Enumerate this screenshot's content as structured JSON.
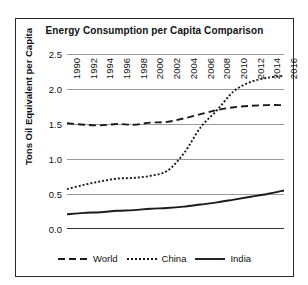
{
  "chart_data": {
    "type": "line",
    "title": "Energy Consumption per Capita Comparison",
    "xlabel": "",
    "ylabel": "Tons Oil Equivalent per Capita",
    "ylim": [
      0.0,
      2.5
    ],
    "yticks": [
      "0.0",
      "0.5",
      "1.0",
      "1.5",
      "2.0",
      "2.5"
    ],
    "ytick_values": [
      0.0,
      0.5,
      1.0,
      1.5,
      2.0,
      2.5
    ],
    "grid": true,
    "legend_position": "bottom",
    "x": [
      1990,
      1992,
      1994,
      1996,
      1998,
      2000,
      2002,
      2004,
      2006,
      2008,
      2010,
      2012,
      2014,
      2016
    ],
    "xtick_labels": [
      "1990",
      "1992",
      "1994",
      "1996",
      "1998",
      "2000",
      "2002",
      "2004",
      "2006",
      "2008",
      "2010",
      "2012",
      "2014",
      "2016"
    ],
    "series": [
      {
        "name": "World",
        "style": "dashed",
        "color": "#1a1a1a",
        "values": [
          1.51,
          1.49,
          1.48,
          1.5,
          1.49,
          1.52,
          1.53,
          1.58,
          1.64,
          1.7,
          1.74,
          1.76,
          1.77,
          1.77
        ]
      },
      {
        "name": "China",
        "style": "dotted",
        "color": "#1a1a1a",
        "values": [
          0.57,
          0.63,
          0.68,
          0.72,
          0.73,
          0.76,
          0.83,
          1.08,
          1.45,
          1.7,
          1.97,
          2.1,
          2.16,
          2.19
        ]
      },
      {
        "name": "India",
        "style": "solid",
        "color": "#1a1a1a",
        "values": [
          0.21,
          0.23,
          0.24,
          0.26,
          0.27,
          0.29,
          0.3,
          0.32,
          0.35,
          0.38,
          0.42,
          0.46,
          0.5,
          0.55
        ]
      }
    ]
  },
  "legend": {
    "items": [
      {
        "label": "World",
        "style": "dashed"
      },
      {
        "label": "China",
        "style": "dotted"
      },
      {
        "label": "India",
        "style": "solid"
      }
    ]
  }
}
